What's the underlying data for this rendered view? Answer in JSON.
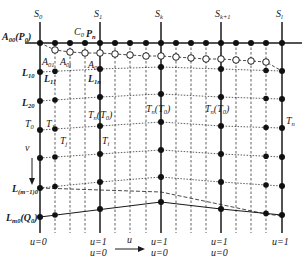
{
  "figure": {
    "type": "parametric-grid-diagram",
    "colors": {
      "line": "#1a1a1a",
      "background": "#ffffff",
      "open_circle_fill": "#ffffff"
    }
  },
  "column_labels": [
    {
      "id": "S0",
      "base": "S",
      "sub": "0",
      "x": 40
    },
    {
      "id": "S1",
      "base": "S",
      "sub": "1",
      "x": 100
    },
    {
      "id": "Sk",
      "base": "S",
      "sub": "k",
      "x": 161
    },
    {
      "id": "Sk+1",
      "base": "S",
      "sub": "k+1",
      "x": 221
    },
    {
      "id": "Sl",
      "base": "S",
      "sub": "l",
      "x": 282
    }
  ],
  "point_labels": {
    "A00": {
      "base": "A",
      "sub": "00",
      "suffix": "(P",
      "suffix_sub": "0",
      "close": ")"
    },
    "C0": {
      "base": "C",
      "sub": "0"
    },
    "Pn": {
      "base": "P",
      "sub": "n"
    },
    "A01": {
      "base": "A",
      "sub": "01"
    },
    "A0j": {
      "base": "A",
      "sub": "0j"
    },
    "A0n": {
      "base": "A",
      "sub": "0n"
    },
    "L10": {
      "base": "L",
      "sub": "10"
    },
    "L11": {
      "base": "L",
      "sub": "11"
    },
    "L1n": {
      "base": "L",
      "sub": "1n"
    },
    "L20": {
      "base": "L",
      "sub": "20"
    },
    "T0": {
      "base": "T",
      "sub": "0"
    },
    "T1": {
      "base": "T",
      "sub": "1"
    },
    "Tj": {
      "base": "T",
      "sub": "j"
    },
    "Ti": {
      "base": "T",
      "sub": "i"
    },
    "Tn_T0_a": {
      "base": "T",
      "sub": "n",
      "suffix": "(T",
      "suffix_sub": "0",
      "close": ")"
    },
    "Tn_T0_b": {
      "base": "T",
      "sub": "n",
      "suffix": "(T",
      "suffix_sub": "0",
      "close": ")"
    },
    "Tn_T0_c": {
      "base": "T",
      "sub": "n",
      "suffix": "(T",
      "suffix_sub": "0",
      "close": ")"
    },
    "Tn": {
      "base": "T",
      "sub": "n"
    },
    "Lm10": {
      "base": "L",
      "sub": "(m−1)0"
    },
    "Lm0": {
      "base": "L",
      "sub": "m0",
      "suffix": "(Q",
      "suffix_sub": "0",
      "close": ")"
    }
  },
  "axes": {
    "v_label": "v",
    "u_label": "u",
    "param_labels": [
      {
        "x": 40,
        "lines": [
          "u=0"
        ]
      },
      {
        "x": 100,
        "lines": [
          "u=1",
          "u=0"
        ]
      },
      {
        "x": 161,
        "lines": [
          "u=1",
          "u=0"
        ]
      },
      {
        "x": 221,
        "lines": [
          "u=1",
          "u=0"
        ]
      },
      {
        "x": 282,
        "lines": [
          "u=1"
        ]
      }
    ]
  },
  "geometry": {
    "solid_columns_x": [
      40,
      100,
      161,
      221,
      282
    ],
    "dashed_columns_x": [
      55,
      70,
      85,
      115,
      130,
      146,
      176,
      191,
      206,
      236,
      251,
      266
    ],
    "top_row_y": 43,
    "column_bottom_y": 233,
    "open_circles": [
      [
        55,
        50
      ],
      [
        70,
        52
      ],
      [
        85,
        53
      ],
      [
        100,
        53
      ],
      [
        115,
        54
      ],
      [
        130,
        55
      ],
      [
        146,
        56
      ],
      [
        161,
        56
      ],
      [
        176,
        57
      ],
      [
        191,
        58
      ],
      [
        206,
        59
      ],
      [
        221,
        59
      ],
      [
        236,
        60
      ],
      [
        251,
        61
      ],
      [
        266,
        62
      ]
    ],
    "rows": {
      "S0": [
        72,
        101,
        130,
        158,
        188,
        217
      ],
      "S1": [
        69,
        97,
        126,
        154,
        182,
        209
      ],
      "Sk": [
        67,
        94,
        122,
        150,
        177,
        202
      ],
      "Sk+1": [
        69,
        97,
        126,
        154,
        182,
        209
      ],
      "Sl": [
        71,
        99,
        128,
        157,
        186,
        215
      ]
    }
  }
}
